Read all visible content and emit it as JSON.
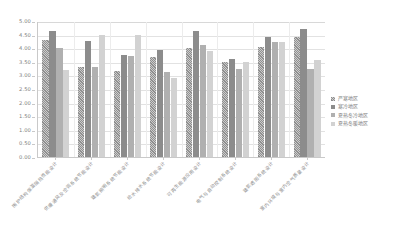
{
  "chart_data": {
    "type": "bar",
    "title": "",
    "subtitle": "",
    "xlabel": "",
    "ylabel": "",
    "ylim": [
      0.0,
      5.0
    ],
    "ytick_step": 0.5,
    "grid": true,
    "legend_position": "right",
    "ytick_labels": [
      "5.00",
      "4.50",
      "4.00",
      "3.50",
      "3.00",
      "2.50",
      "2.00",
      "1.50",
      "1.00",
      "0.50",
      "0.00"
    ],
    "categories": [
      "围护结构保温隔热性能设计",
      "供暖通风及空调系统节能设计",
      "建筑照明系统节能设计",
      "给水排水系统节能设计",
      "可再生能源应用设计",
      "电气与自动控制系统设计",
      "建筑遮阳系统设计",
      "室内环境与室内空气质量设计"
    ],
    "series": [
      {
        "name": "严寒地区",
        "values": [
          4.3,
          3.32,
          3.18,
          3.68,
          4.0,
          3.48,
          4.05,
          4.4
        ]
      },
      {
        "name": "寒冷地区",
        "values": [
          4.62,
          4.25,
          3.75,
          3.95,
          4.62,
          3.62,
          4.4,
          4.72
        ]
      },
      {
        "name": "夏热冬冷地区",
        "values": [
          4.0,
          3.32,
          3.7,
          3.12,
          4.1,
          3.25,
          4.22,
          3.25
        ]
      },
      {
        "name": "夏热冬暖地区",
        "values": [
          3.2,
          4.5,
          4.5,
          2.92,
          3.88,
          3.5,
          4.22,
          3.55
        ]
      }
    ]
  }
}
